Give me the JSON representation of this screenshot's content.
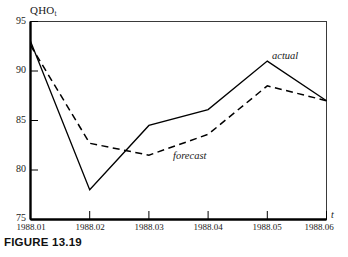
{
  "figure": {
    "caption": "FIGURE 13.19"
  },
  "chart_data": {
    "type": "line",
    "title": "",
    "subtitle": "",
    "xlabel": "t",
    "ylabel": "QHO",
    "ylabel_subscript": "t",
    "categories": [
      "1988.01",
      "1988.02",
      "1988.03",
      "1988.04",
      "1988.05",
      "1988.06"
    ],
    "x": [
      1988.01,
      1988.02,
      1988.03,
      1988.04,
      1988.05,
      1988.06
    ],
    "xlim": [
      1988.01,
      1988.06
    ],
    "ylim": [
      75,
      95
    ],
    "yticks": [
      75,
      80,
      85,
      90,
      95
    ],
    "ytick_labels": [
      "75",
      "80",
      "85",
      "90",
      "95"
    ],
    "xtick_labels": [
      "1988.01",
      "1988.02",
      "1988.03",
      "1988.04",
      "1988.05",
      "1988.06"
    ],
    "grid": false,
    "legend_position": "inline-annotation",
    "series": [
      {
        "name": "actual",
        "style": "solid",
        "color": "#000000",
        "values": [
          93.0,
          78.0,
          84.5,
          86.1,
          91.0,
          87.0
        ]
      },
      {
        "name": "forecast",
        "style": "dashed",
        "color": "#000000",
        "values": [
          92.6,
          82.7,
          81.5,
          83.6,
          88.5,
          87.0
        ]
      }
    ],
    "annotations": [
      {
        "text": "actual",
        "series": "actual"
      },
      {
        "text": "forecast",
        "series": "forecast"
      }
    ]
  },
  "colors": {
    "axis": "#000000",
    "line": "#000000",
    "background": "#ffffff"
  }
}
